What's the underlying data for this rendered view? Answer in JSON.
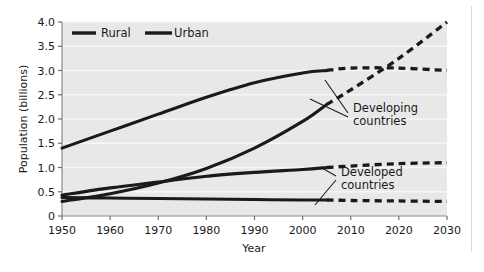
{
  "chart_data": {
    "type": "line",
    "title": "",
    "xlabel": "Year",
    "ylabel": "Population (billions)",
    "xlim": [
      1950,
      2030
    ],
    "ylim": [
      0,
      4.0
    ],
    "grid": true,
    "legend_position": "top-left-inside",
    "xticks": [
      1950,
      1960,
      1970,
      1980,
      1990,
      2000,
      2010,
      2020,
      2030
    ],
    "xtick_labels": [
      "1950",
      "1960",
      "1970",
      "1980",
      "1990",
      "2000",
      "2010",
      "2020",
      "2030"
    ],
    "yticks": [
      0,
      0.5,
      1.0,
      1.5,
      2.0,
      2.5,
      3.0,
      3.5,
      4.0
    ],
    "ytick_labels": [
      "0",
      "0.5",
      "1.0",
      "1.5",
      "2.0",
      "2.5",
      "3.0",
      "3.5",
      "4.0"
    ],
    "legend": [
      {
        "name": "Rural",
        "style": "solid",
        "color": "#1a1a1a"
      },
      {
        "name": "Urban",
        "style": "solid",
        "color": "#1a1a1a"
      }
    ],
    "annotations": [
      {
        "text": "Developing countries",
        "line1": "Developing",
        "line2": "countries",
        "x": 2012,
        "y": 2.35
      },
      {
        "text": "Developed countries",
        "line1": "Developed",
        "line2": "countries",
        "x": 2012,
        "y": 0.82
      }
    ],
    "projection_start_year": 2005,
    "note": "Solid segments are historical data (1950-2005); dashed segments are projections (2005-2030).",
    "series": [
      {
        "name": "Developing countries - Rural",
        "group": "Developing countries",
        "type": "Rural",
        "style": "solid-then-dashed",
        "x": [
          1950,
          1960,
          1970,
          1980,
          1990,
          2000,
          2005,
          2010,
          2020,
          2030
        ],
        "values": [
          1.4,
          1.75,
          2.1,
          2.45,
          2.75,
          2.95,
          3.0,
          3.05,
          3.05,
          3.0
        ]
      },
      {
        "name": "Developing countries - Urban",
        "group": "Developing countries",
        "type": "Urban",
        "style": "solid-then-dashed",
        "x": [
          1950,
          1960,
          1970,
          1980,
          1990,
          2000,
          2005,
          2010,
          2020,
          2030
        ],
        "values": [
          0.3,
          0.46,
          0.68,
          0.98,
          1.4,
          1.95,
          2.3,
          2.6,
          3.25,
          4.0
        ]
      },
      {
        "name": "Developed countries - Urban",
        "group": "Developed countries",
        "type": "Urban",
        "style": "solid-then-dashed",
        "x": [
          1950,
          1960,
          1970,
          1980,
          1990,
          2000,
          2005,
          2010,
          2020,
          2030
        ],
        "values": [
          0.43,
          0.58,
          0.7,
          0.82,
          0.9,
          0.96,
          1.0,
          1.03,
          1.08,
          1.1
        ]
      },
      {
        "name": "Developed countries - Rural",
        "group": "Developed countries",
        "type": "Rural",
        "style": "solid-then-dashed",
        "x": [
          1950,
          1960,
          1970,
          1980,
          1990,
          2000,
          2005,
          2010,
          2020,
          2030
        ],
        "values": [
          0.38,
          0.37,
          0.36,
          0.35,
          0.34,
          0.33,
          0.33,
          0.32,
          0.31,
          0.3
        ]
      }
    ],
    "colors": {
      "line": "#1a1a1a",
      "plot_background": "#e8e8e8",
      "gridline": "#f7f7f7",
      "axis": "#6e6e6e",
      "page_background": "#ffffff"
    }
  }
}
